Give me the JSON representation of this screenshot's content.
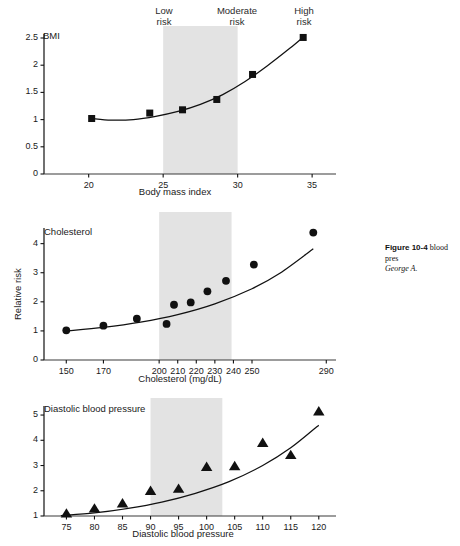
{
  "figure": {
    "risk_bands": [
      {
        "name": "low",
        "label": "Low\nrisk"
      },
      {
        "name": "moderate",
        "label": "Moderate\nrisk"
      },
      {
        "name": "high",
        "label": "High\nrisk"
      }
    ],
    "shade_color": "#e3e3e3",
    "ink_color": "#111111",
    "caption_head": "Figure 10-4",
    "caption_body": "blood pres",
    "caption_source": "George A."
  },
  "chart_data": [
    {
      "type": "scatter",
      "name": "bmi-panel",
      "title": "BMI",
      "xlabel": "Body mass index",
      "ylabel": "",
      "marker": "square",
      "xlim": [
        17.0,
        36.2
      ],
      "ylim": [
        0,
        2.5
      ],
      "xticks": [
        20,
        25,
        30,
        35
      ],
      "xticklabels": [
        "20",
        "25",
        "30",
        "35"
      ],
      "yticks": [
        0,
        0.5,
        1,
        1.5,
        2,
        2.5
      ],
      "yticklabels": [
        "0",
        "0.5",
        "1",
        "1.5",
        "2",
        "2.5"
      ],
      "grid": false,
      "shaded_span": [
        25,
        30
      ],
      "x": [
        20.2,
        24.1,
        26.3,
        28.6,
        31.0,
        34.4
      ],
      "values": [
        1.02,
        1.12,
        1.18,
        1.37,
        1.83,
        2.51
      ],
      "fit_curve": {
        "x": [
          20.2,
          21.5,
          23.0,
          24.5,
          26.0,
          27.5,
          29.0,
          30.5,
          32.0,
          33.5,
          34.5
        ],
        "y": [
          1.02,
          0.99,
          1.0,
          1.06,
          1.15,
          1.28,
          1.46,
          1.7,
          1.99,
          2.31,
          2.54
        ]
      }
    },
    {
      "type": "scatter",
      "name": "cholesterol-panel",
      "title": "Cholesterol",
      "xlabel": "Cholesterol (mg/dL)",
      "ylabel": "Relative risk",
      "marker": "circle",
      "xlim": [
        138,
        292
      ],
      "ylim": [
        0,
        4.4
      ],
      "xticks": [
        150,
        170,
        200,
        210,
        220,
        230,
        240,
        250,
        290
      ],
      "xticklabels": [
        "150",
        "170",
        "200",
        "210",
        "220",
        "230",
        "240",
        "250",
        "290"
      ],
      "yticks": [
        0,
        1,
        2,
        3,
        4
      ],
      "yticklabels": [
        "0",
        "1",
        "2",
        "3",
        "4"
      ],
      "grid": false,
      "shaded_span": [
        200,
        239
      ],
      "x": [
        150,
        170,
        188,
        204,
        208,
        217,
        226,
        236,
        251,
        283
      ],
      "values": [
        1.02,
        1.18,
        1.42,
        1.24,
        1.9,
        1.98,
        2.36,
        2.72,
        3.28,
        4.38
      ],
      "fit_curve": {
        "x": [
          150,
          170,
          190,
          210,
          230,
          250,
          265,
          283
        ],
        "y": [
          1.0,
          1.12,
          1.3,
          1.56,
          1.93,
          2.45,
          2.98,
          3.82
        ]
      }
    },
    {
      "type": "scatter",
      "name": "diastolic-bp-panel",
      "title": "Diastolic blood pressure",
      "xlabel": "Diastolic blood pressure",
      "ylabel": "",
      "marker": "triangle",
      "xlim": [
        71,
        122
      ],
      "ylim": [
        1,
        5.2
      ],
      "xticks": [
        75,
        80,
        85,
        90,
        95,
        100,
        105,
        110,
        115,
        120
      ],
      "xticklabels": [
        "75",
        "80",
        "85",
        "90",
        "95",
        "100",
        "105",
        "110",
        "115",
        "120"
      ],
      "yticks": [
        1,
        2,
        3,
        4,
        5
      ],
      "yticklabels": [
        "1",
        "2",
        "3",
        "4",
        "5"
      ],
      "grid": false,
      "shaded_span": [
        90,
        102.8
      ],
      "x": [
        75,
        80,
        85,
        90,
        95,
        100,
        105,
        110,
        115,
        120
      ],
      "values": [
        1.1,
        1.3,
        1.5,
        2.0,
        2.08,
        2.95,
        2.98,
        3.9,
        3.42,
        5.15
      ],
      "fit_curve": {
        "x": [
          74,
          80,
          86,
          92,
          98,
          104,
          110,
          115,
          120
        ],
        "y": [
          1.02,
          1.12,
          1.3,
          1.55,
          1.9,
          2.36,
          3.0,
          3.7,
          4.6
        ]
      }
    }
  ]
}
